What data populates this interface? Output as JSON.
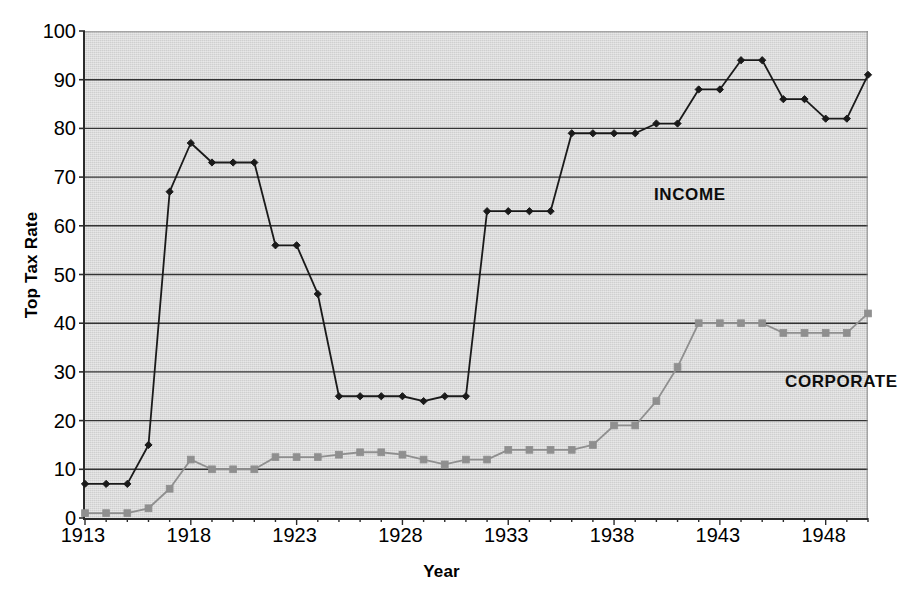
{
  "chart_data": {
    "type": "line",
    "title": "",
    "xlabel": "Year",
    "ylabel": "Top Tax Rate",
    "xlim": [
      1913,
      1950
    ],
    "ylim": [
      0,
      100
    ],
    "grid": true,
    "grid_axis": "y",
    "legend_position": "inline-annotation",
    "x": [
      1913,
      1914,
      1915,
      1916,
      1917,
      1918,
      1919,
      1920,
      1921,
      1922,
      1923,
      1924,
      1925,
      1926,
      1927,
      1928,
      1929,
      1930,
      1931,
      1932,
      1933,
      1934,
      1935,
      1936,
      1937,
      1938,
      1939,
      1940,
      1941,
      1942,
      1943,
      1944,
      1945,
      1946,
      1947,
      1948,
      1949,
      1950
    ],
    "series": [
      {
        "name": "INCOME",
        "color": "#1a1a1a",
        "marker": "diamond",
        "values": [
          7,
          7,
          7,
          15,
          67,
          77,
          73,
          73,
          73,
          56,
          56,
          46,
          25,
          25,
          25,
          25,
          24,
          25,
          25,
          63,
          63,
          63,
          63,
          79,
          79,
          79,
          79,
          81,
          81,
          88,
          88,
          94,
          94,
          86,
          86,
          82,
          82,
          91
        ]
      },
      {
        "name": "CORPORATE",
        "color": "#8f8f8f",
        "marker": "square",
        "values": [
          1,
          1,
          1,
          2,
          6,
          12,
          10,
          10,
          10,
          12.5,
          12.5,
          12.5,
          13,
          13.5,
          13.5,
          13,
          12,
          11,
          12,
          12,
          14,
          14,
          14,
          14,
          15,
          19,
          19,
          24,
          31,
          40,
          40,
          40,
          40,
          38,
          38,
          38,
          38,
          42
        ]
      }
    ],
    "y_ticks": [
      0,
      10,
      20,
      30,
      40,
      50,
      60,
      70,
      80,
      90,
      100
    ],
    "x_ticks_labeled": [
      1913,
      1918,
      1923,
      1928,
      1933,
      1938,
      1943,
      1948
    ],
    "annotations": [
      {
        "text": "INCOME",
        "x": 1935,
        "y": 72
      },
      {
        "text": "CORPORATE",
        "x": 1941,
        "y": 34
      }
    ]
  },
  "axes": {
    "y_title": "Top Tax Rate",
    "x_title": "Year"
  },
  "colors": {
    "plot_background": "#cfcfcf",
    "axis_line": "#2b2b2b",
    "gridline": "#333333",
    "income_series": "#1a1a1a",
    "corporate_series": "#8f8f8f",
    "page_background": "#ffffff",
    "text": "#000000"
  }
}
